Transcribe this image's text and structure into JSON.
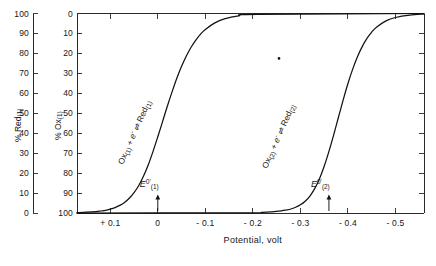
{
  "chart_data": {
    "type": "line",
    "title": "",
    "xlabel": "Potential, volt",
    "ylabel_left": "% Red(1)",
    "ylabel_inner": "% Ox(1)",
    "xlim": [
      0.17,
      -0.56
    ],
    "x_ticks": [
      {
        "value": 0.1,
        "label": "+ 0.1"
      },
      {
        "value": 0.0,
        "label": "0"
      },
      {
        "value": -0.1,
        "label": "- 0.1"
      },
      {
        "value": -0.2,
        "label": "- 0.2"
      },
      {
        "value": -0.3,
        "label": "- 0.3"
      },
      {
        "value": -0.4,
        "label": "- 0.4"
      },
      {
        "value": -0.5,
        "label": "- 0.5"
      }
    ],
    "y_left_ticks": [
      {
        "value": 100,
        "label": "100"
      },
      {
        "value": 90,
        "label": "90"
      },
      {
        "value": 80,
        "label": "80"
      },
      {
        "value": 70,
        "label": "70"
      },
      {
        "value": 60,
        "label": "60"
      },
      {
        "value": 50,
        "label": "50"
      },
      {
        "value": 40,
        "label": "40"
      },
      {
        "value": 30,
        "label": "30"
      },
      {
        "value": 20,
        "label": "20"
      },
      {
        "value": 10,
        "label": "10"
      },
      {
        "value": 0,
        "label": "0"
      }
    ],
    "y_inner_ticks": [
      {
        "value": 0,
        "label": "0"
      },
      {
        "value": 10,
        "label": "10"
      },
      {
        "value": 20,
        "label": "20"
      },
      {
        "value": 30,
        "label": "30"
      },
      {
        "value": 40,
        "label": "40"
      },
      {
        "value": 50,
        "label": "50"
      },
      {
        "value": 60,
        "label": "60"
      },
      {
        "value": 70,
        "label": "70"
      },
      {
        "value": 80,
        "label": "80"
      },
      {
        "value": 90,
        "label": "90"
      },
      {
        "value": 100,
        "label": "100"
      }
    ],
    "ylim_inner": [
      0,
      100
    ],
    "grid": false,
    "legend_position": "none",
    "series": [
      {
        "name": "Ox(1) + e- = Red(1)",
        "E_half": 0.0,
        "slope_mV": 25.7,
        "x": [
          0.17,
          0.15,
          0.13,
          0.12,
          0.11,
          0.1,
          0.09,
          0.08,
          0.07,
          0.06,
          0.05,
          0.04,
          0.03,
          0.02,
          0.01,
          0.0,
          -0.01,
          -0.02,
          -0.03,
          -0.04,
          -0.05,
          -0.06,
          -0.07,
          -0.08,
          -0.09,
          -0.1,
          -0.12,
          -0.14,
          -0.17,
          -0.21,
          -0.56
        ],
        "percent_ox": [
          99.8,
          99.6,
          99.3,
          99.0,
          98.7,
          98.1,
          97.3,
          96.2,
          94.7,
          92.6,
          89.8,
          86.2,
          81.5,
          75.8,
          69.1,
          61.8,
          54.2,
          46.5,
          39.3,
          32.5,
          26.5,
          21.3,
          16.9,
          13.3,
          10.3,
          8.0,
          4.7,
          2.7,
          1.2,
          0.4,
          0.0
        ]
      },
      {
        "name": "Ox(2) + e- = Red(2)",
        "E_half": -0.36,
        "slope_mV": 25.7,
        "x": [
          0.17,
          -0.18,
          -0.22,
          -0.24,
          -0.26,
          -0.27,
          -0.28,
          -0.29,
          -0.3,
          -0.31,
          -0.32,
          -0.33,
          -0.34,
          -0.35,
          -0.36,
          -0.37,
          -0.38,
          -0.39,
          -0.4,
          -0.41,
          -0.42,
          -0.43,
          -0.44,
          -0.45,
          -0.46,
          -0.48,
          -0.5,
          -0.53,
          -0.56
        ],
        "percent_ox": [
          100.0,
          99.9,
          99.7,
          99.4,
          98.9,
          98.5,
          98.0,
          97.1,
          95.9,
          94.1,
          91.5,
          87.8,
          82.9,
          76.6,
          69.1,
          60.8,
          52.0,
          43.3,
          35.1,
          27.9,
          21.7,
          16.6,
          12.5,
          9.3,
          6.9,
          3.7,
          2.0,
          0.8,
          0.3
        ]
      }
    ],
    "annotations": [
      {
        "name": "E-formal-1",
        "text": "E",
        "superscript": "0'",
        "subscript": "(1)",
        "x_value": 0.0,
        "arrow": "up"
      },
      {
        "name": "E-formal-2",
        "text": "E",
        "superscript": "0'",
        "subscript": "(2)",
        "x_value": -0.36,
        "arrow": "up"
      },
      {
        "name": "stray-mark",
        "x_value": -0.255,
        "y_percent_ox": 22.5
      }
    ],
    "curve_labels": [
      {
        "head": "Ox",
        "head_sub": "(1)",
        "mid": " + e",
        "mid_sup": "-",
        "eq": " ⇌ ",
        "tail": "Red",
        "tail_sub": "(1)"
      },
      {
        "head": "Ox",
        "head_sub": "(2)",
        "mid": " + e",
        "mid_sup": "-",
        "eq": " ⇌ ",
        "tail": "Red",
        "tail_sub": "(2)"
      }
    ],
    "colors": {
      "curve": "#121212",
      "axis": "#2a2a2a",
      "background": "#ffffff",
      "text": "#161616"
    }
  },
  "axis_titles": {
    "left": {
      "percent": "%",
      "species": "Red",
      "index": "(1)"
    },
    "inner": {
      "percent": "%",
      "species": "Ox",
      "index": "(1)"
    },
    "bottom": "Potential, volt"
  }
}
